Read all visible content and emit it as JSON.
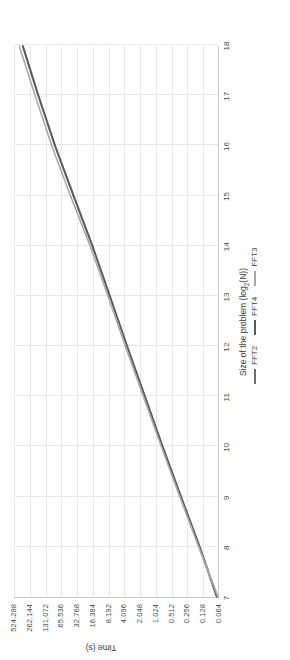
{
  "chart_data": {
    "type": "line",
    "title": "",
    "xlabel": "Size of the problem (log2(N))",
    "xlabel_pre": "Size of the problem (log",
    "xlabel_sub": "2",
    "xlabel_post": "(N))",
    "ylabel": "Time (s)",
    "x": [
      7,
      8,
      9,
      10,
      11,
      12,
      13,
      14,
      15,
      16,
      17,
      18
    ],
    "xticks": [
      "7",
      "8",
      "9",
      "10",
      "11",
      "12",
      "13",
      "14",
      "15",
      "16",
      "17",
      "18"
    ],
    "xlim": [
      7,
      18
    ],
    "yticks": [
      "0.064",
      "0.128",
      "0.256",
      "0.512",
      "1.024",
      "2.048",
      "4.096",
      "8.192",
      "16.384",
      "32.768",
      "65.536",
      "131.072",
      "262.144",
      "524.288"
    ],
    "yvalues": [
      0.064,
      0.128,
      0.256,
      0.512,
      1.024,
      2.048,
      4.096,
      8.192,
      16.384,
      32.768,
      65.536,
      131.072,
      262.144,
      524.288
    ],
    "yscale": "log2",
    "ylim": [
      0.064,
      524.288
    ],
    "grid": true,
    "legend_position": "top-right-outside",
    "series": [
      {
        "name": "FFT2",
        "color": "#6e6e6e",
        "values": [
          0.068,
          0.145,
          0.33,
          0.74,
          1.62,
          3.55,
          7.6,
          16.4,
          38.0,
          86.0,
          180.0,
          360.0
        ]
      },
      {
        "name": "FFT4",
        "color": "#5a5a5a",
        "values": [
          0.066,
          0.142,
          0.325,
          0.73,
          1.6,
          3.5,
          7.5,
          16.2,
          37.0,
          84.0,
          176.0,
          352.0
        ]
      },
      {
        "name": "FFT3",
        "color": "#a8a8a8",
        "values": [
          0.064,
          0.15,
          0.345,
          0.78,
          1.72,
          3.8,
          8.2,
          18.0,
          43.0,
          98.0,
          205.0,
          415.0
        ]
      }
    ]
  },
  "legend": {
    "items": [
      {
        "label": "FFT2",
        "color": "#6e6e6e"
      },
      {
        "label": "FFT4",
        "color": "#5a5a5a"
      },
      {
        "label": "FFT3",
        "color": "#a8a8a8"
      }
    ]
  },
  "colors": {
    "grid": "#e8e8e8",
    "axis": "#c8c8c8",
    "text": "#3c3c3c",
    "background": "#ffffff"
  }
}
